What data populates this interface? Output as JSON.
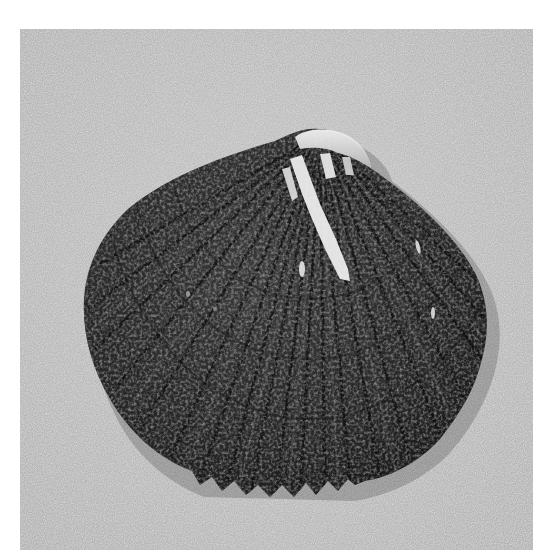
{
  "image": {
    "subject": "Dark ribbed cockle shell on sand",
    "alt": "Photograph of a dark, heavily ribbed cockle shell with a pale white-streaked umbo, resting on fine gray sand",
    "palette": {
      "border": "#ffffff",
      "sand": "#b9b9b9",
      "sand_light": "#d2d2d2",
      "sand_speck": "#4a4a4a",
      "shell_dark": "#1e1e1e",
      "shell_mid": "#3a3a3a",
      "shell_highlight": "#f2f2f2"
    },
    "frame": {
      "x": 20,
      "y": 29,
      "width": 513,
      "height": 521
    }
  }
}
